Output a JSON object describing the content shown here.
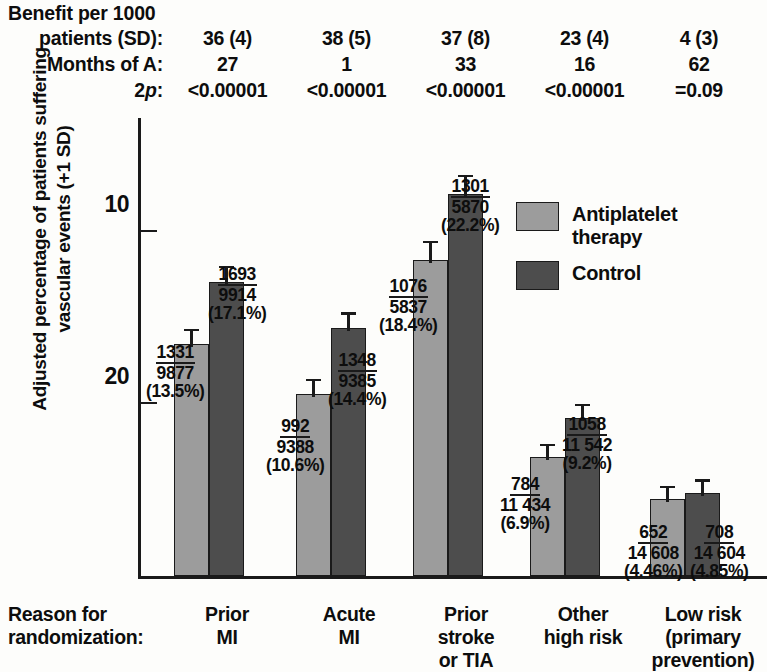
{
  "header": {
    "row_labels": [
      "Benefit per 1000\npatients (SD):",
      "Months of A:",
      "2p:"
    ],
    "title_line1": "Benefit per 1000",
    "label_benefit": "patients (SD):",
    "label_months": "Months of A:",
    "label_2p_prefix": "2",
    "label_2p_italic": "p",
    "label_2p_suffix": ":",
    "benefit": [
      "36 (4)",
      "38 (5)",
      "37 (8)",
      "23 (4)",
      "4 (3)"
    ],
    "months": [
      "27",
      "1",
      "33",
      "16",
      "62"
    ],
    "twop": [
      "<0.00001",
      "<0.00001",
      "<0.00001",
      "<0.00001",
      "=0.09"
    ]
  },
  "axis": {
    "ytitle": "Adjusted percentage of patients suffering\nvascular events (+1 SD)",
    "yticks": [
      "20",
      "10"
    ],
    "xaxis_label": "Reason for\nrandomization:"
  },
  "legend": {
    "items": [
      {
        "label": "Antiplatelet\ntherapy",
        "color": "#9c9c9c"
      },
      {
        "label": "Control",
        "color": "#4d4d4d"
      }
    ]
  },
  "chart_data": {
    "type": "bar",
    "title": "",
    "xlabel": "Reason for randomization:",
    "ylabel": "Adjusted percentage of patients suffering vascular events (+1 SD)",
    "ylim": [
      0,
      24
    ],
    "yticks": [
      10,
      20
    ],
    "grid": false,
    "legend_position": "upper-right-inside",
    "categories": [
      "Prior\nMI",
      "Acute\nMI",
      "Prior\nstroke\nor TIA",
      "Other\nhigh risk",
      "Low risk\n(primary\nprevention)"
    ],
    "series": [
      {
        "name": "Antiplatelet therapy",
        "color": "#9c9c9c",
        "values": [
          13.5,
          10.6,
          18.4,
          6.9,
          4.46
        ],
        "events": [
          1331,
          992,
          1076,
          784,
          652
        ],
        "totals": [
          "9877",
          "9388",
          "5837",
          "11 434",
          "14 608"
        ],
        "pct_labels": [
          "(13.5%)",
          "(10.6%)",
          "(18.4%)",
          "(6.9%)",
          "(4.46%)"
        ],
        "errors": [
          0.45,
          0.45,
          0.65,
          0.35,
          0.35
        ]
      },
      {
        "name": "Control",
        "color": "#4d4d4d",
        "values": [
          17.1,
          14.4,
          22.2,
          9.2,
          4.85
        ],
        "events": [
          1693,
          1348,
          1301,
          1058,
          708
        ],
        "totals": [
          "9914",
          "9385",
          "5870",
          "11 542",
          "14 604"
        ],
        "pct_labels": [
          "(17.1%)",
          "(14.4%)",
          "(22.2%)",
          "(9.2%)",
          "(4.85%)"
        ],
        "errors": [
          0.5,
          0.5,
          0.7,
          0.4,
          0.35
        ]
      }
    ],
    "annotations": {
      "benefit_per_1000_sd": [
        "36 (4)",
        "38 (5)",
        "37 (8)",
        "23 (4)",
        "4 (3)"
      ],
      "months_of_treatment": [
        "27",
        "1",
        "33",
        "16",
        "62"
      ],
      "two_p": [
        "<0.00001",
        "<0.00001",
        "<0.00001",
        "<0.00001",
        "=0.09"
      ]
    }
  }
}
